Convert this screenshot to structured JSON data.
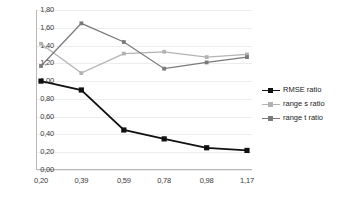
{
  "chart_data": {
    "type": "line",
    "title": "",
    "xlabel": "",
    "ylabel": "",
    "x": [
      0.2,
      0.39,
      0.59,
      0.78,
      0.98,
      1.17
    ],
    "categories": [
      "0,20",
      "0,39",
      "0,59",
      "0,78",
      "0,98",
      "1,17"
    ],
    "ylim": [
      0.0,
      1.8
    ],
    "yticks": [
      0.0,
      0.2,
      0.4,
      0.6,
      0.8,
      1.0,
      1.2,
      1.4,
      1.6,
      1.8
    ],
    "ytick_labels": [
      "0,00",
      "0,20",
      "0,40",
      "0,60",
      "0,80",
      "1,00",
      "1,20",
      "1,40",
      "1,60",
      "1,80"
    ],
    "grid": true,
    "legend_position": "right",
    "series": [
      {
        "name": "RMSE ratio",
        "color": "#111111",
        "marker": "square",
        "values": [
          1.0,
          0.9,
          0.45,
          0.35,
          0.25,
          0.22
        ]
      },
      {
        "name": "range s ratio",
        "color": "#b3b3b3",
        "marker": "square",
        "values": [
          1.42,
          1.09,
          1.31,
          1.33,
          1.27,
          1.3
        ]
      },
      {
        "name": "range t ratio",
        "color": "#7a7a7a",
        "marker": "square",
        "values": [
          1.17,
          1.65,
          1.44,
          1.14,
          1.21,
          1.27
        ]
      }
    ]
  },
  "colors": {
    "background": "#ffffff",
    "gridline": "#ededed",
    "axis": "#b8b8b8",
    "tick_text": "#3a3a3a"
  }
}
